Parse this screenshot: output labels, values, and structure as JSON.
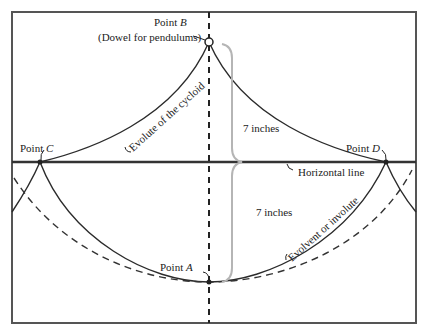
{
  "diagram": {
    "labels": {
      "point_b": "Point ",
      "point_b_letter": "B",
      "dowel": "(Dowel for pendulums)",
      "point_c": "Point ",
      "point_c_letter": "C",
      "point_d": "Point ",
      "point_d_letter": "D",
      "point_a": "Point ",
      "point_a_letter": "A",
      "evolute": "Evolute of the cycloid",
      "upper_distance": "7 inches",
      "lower_distance": "7 inches",
      "horizontal_line": "Horizontal line",
      "evolvent": "Evolvent or involute"
    },
    "colors": {
      "line": "#2b2b2b",
      "frame": "#555555",
      "brace": "#b5b5b5"
    }
  }
}
